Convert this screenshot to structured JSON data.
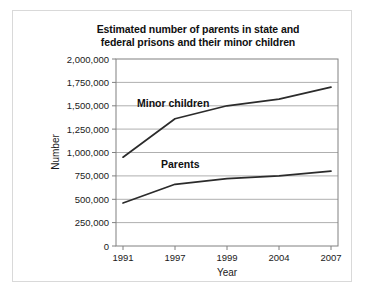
{
  "chart_data": {
    "type": "line",
    "title": "Estimated number of parents in state and federal prisons and their minor children",
    "title_line1": "Estimated number of parents in state and",
    "title_line2": "federal prisons and their minor children",
    "xlabel": "Year",
    "ylabel": "Number",
    "categories": [
      "1991",
      "1997",
      "1999",
      "2004",
      "2007"
    ],
    "ylim": [
      0,
      2000000
    ],
    "ytick_values": [
      0,
      250000,
      500000,
      750000,
      1000000,
      1250000,
      1500000,
      1750000,
      2000000
    ],
    "ytick_labels": [
      "0",
      "250,000",
      "500,000",
      "750,000",
      "1,000,000",
      "1,250,000",
      "1,500,000",
      "1,750,000",
      "2,000,000"
    ],
    "grid": true,
    "legend_position": "inline-labels",
    "series": [
      {
        "name": "Minor children",
        "label": "Minor children",
        "color": "#2b2b2b",
        "values": [
          950000,
          1360000,
          1500000,
          1570000,
          1700000
        ]
      },
      {
        "name": "Parents",
        "label": "Parents",
        "color": "#2b2b2b",
        "values": [
          460000,
          660000,
          720000,
          750000,
          800000
        ]
      }
    ]
  }
}
